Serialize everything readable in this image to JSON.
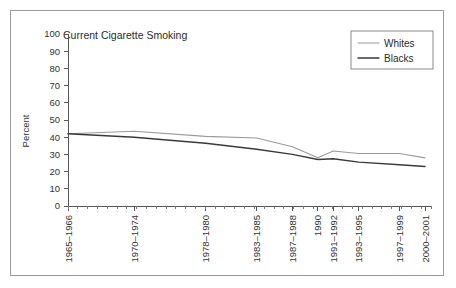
{
  "chart_data": {
    "type": "line",
    "title": "Current Cigarette Smoking",
    "xlabel": "",
    "ylabel": "Percent",
    "ylim": [
      0,
      100
    ],
    "ytick_labels": [
      "0",
      "10",
      "20",
      "30",
      "40",
      "50",
      "60",
      "70",
      "80",
      "90",
      "100"
    ],
    "ytick_values": [
      0,
      10,
      20,
      30,
      40,
      50,
      60,
      70,
      80,
      90,
      100
    ],
    "grid": false,
    "legend_position": "top-right",
    "categories": [
      "1965–1966",
      "1970–1974",
      "1978–1980",
      "1983–1985",
      "1987–1988",
      "1990",
      "1991–1992",
      "1993–1995",
      "1997–1999",
      "2000–2001"
    ],
    "series": [
      {
        "name": "Whites",
        "color": "#9a9a9a",
        "values": [
          42,
          43.5,
          40.5,
          39.5,
          34.5,
          28,
          32,
          30.5,
          30.5,
          28
        ]
      },
      {
        "name": "Blacks",
        "color": "#3a3a3a",
        "values": [
          42,
          40,
          36.5,
          33,
          30,
          27,
          27.5,
          25.5,
          24,
          23
        ]
      }
    ]
  },
  "legend": {
    "entries": [
      {
        "label": "Whites"
      },
      {
        "label": "Blacks"
      }
    ]
  },
  "colors": {
    "whites_line": "#9a9a9a",
    "blacks_line": "#3a3a3a",
    "frame_border": "#9a9a9a",
    "axis": "#555555",
    "text": "#333333"
  }
}
